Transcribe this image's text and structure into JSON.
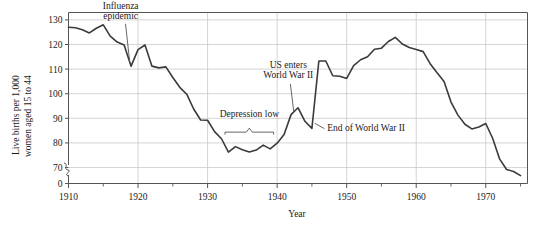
{
  "chart_data": {
    "type": "line",
    "title": "",
    "xlabel": "Year",
    "ylabel_line1": "Live births per 1,000",
    "ylabel_line2": "women aged 15 to 44",
    "xlim": [
      1910,
      1976
    ],
    "ylim": [
      65,
      135
    ],
    "y_axis_break": true,
    "y_break_label": "0",
    "grid": true,
    "legend": "none",
    "ytick_labels": [
      "130",
      "120",
      "110",
      "100",
      "90",
      "80",
      "70",
      "0"
    ],
    "ytick_values": [
      130,
      120,
      110,
      100,
      90,
      80,
      70,
      0
    ],
    "xtick_labels": [
      "1910",
      "1920",
      "1930",
      "1940",
      "1950",
      "1960",
      "1970"
    ],
    "xtick_values": [
      1910,
      1920,
      1930,
      1940,
      1950,
      1960,
      1970
    ],
    "xminor_ticks": [
      1915,
      1925,
      1935,
      1945,
      1955,
      1965,
      1975
    ],
    "series": [
      {
        "name": "Live births per 1,000 women aged 15 to 44",
        "color": "#3a3a3a",
        "x": [
          1910,
          1911,
          1912,
          1913,
          1914,
          1915,
          1916,
          1917,
          1918,
          1919,
          1920,
          1921,
          1922,
          1923,
          1924,
          1925,
          1926,
          1927,
          1928,
          1929,
          1930,
          1931,
          1932,
          1933,
          1934,
          1935,
          1936,
          1937,
          1938,
          1939,
          1940,
          1941,
          1942,
          1943,
          1944,
          1945,
          1946,
          1947,
          1948,
          1949,
          1950,
          1951,
          1952,
          1953,
          1954,
          1955,
          1956,
          1957,
          1958,
          1959,
          1960,
          1961,
          1962,
          1963,
          1964,
          1965,
          1966,
          1967,
          1968,
          1969,
          1970,
          1971,
          1972,
          1973,
          1974,
          1975
        ],
        "y": [
          127.0,
          126.8,
          126.0,
          124.7,
          126.6,
          128.0,
          123.4,
          121.0,
          119.8,
          111.2,
          117.9,
          119.8,
          111.2,
          110.5,
          110.9,
          106.6,
          102.6,
          99.8,
          93.8,
          89.3,
          89.2,
          84.6,
          81.7,
          76.3,
          78.5,
          77.2,
          76.3,
          77.1,
          79.1,
          77.6,
          79.9,
          83.4,
          91.5,
          94.3,
          88.8,
          85.9,
          113.3,
          113.3,
          107.3,
          107.1,
          106.2,
          111.4,
          113.8,
          115.0,
          118.1,
          118.5,
          121.2,
          122.9,
          120.2,
          118.8,
          118.0,
          117.1,
          112.2,
          108.5,
          105.0,
          96.6,
          91.3,
          87.6,
          85.7,
          86.5,
          87.9,
          81.8,
          73.4,
          69.2,
          68.4,
          66.7
        ]
      }
    ],
    "annotations": [
      {
        "id": "influenza",
        "line1": "Influenza",
        "line2": "epidemic",
        "text_x": 1917.5,
        "text_y": 134.5,
        "leader_from": [
          1918.2,
          128.4
        ],
        "leader_to": [
          1918.8,
          113.0
        ]
      },
      {
        "id": "depression-low",
        "line1": "Depression low",
        "line2": "",
        "text_x": 1936.0,
        "text_y": 90.5,
        "brace_from": 1932.5,
        "brace_to": 1939.5,
        "brace_y": 85.0
      },
      {
        "id": "us-enters-wwii",
        "line1": "US enters",
        "line2": "World War II",
        "text_x": 1941.6,
        "text_y": 110.5,
        "leader_from": [
          1941.9,
          104.0
        ],
        "leader_to": [
          1942.4,
          92.5
        ]
      },
      {
        "id": "end-of-wwii",
        "line1": "End of World War II",
        "line2": "",
        "text_x": 1947.2,
        "text_y": 85.0,
        "leader_from": [
          1946.8,
          85.8
        ],
        "leader_to": [
          1945.4,
          88.0
        ]
      }
    ],
    "style": {
      "line_color": "#3a3a3a",
      "grid_color": "#c9c9c9",
      "frame_color": "#555555",
      "text_color": "#1a1a1a",
      "background": "#ffffff"
    }
  }
}
